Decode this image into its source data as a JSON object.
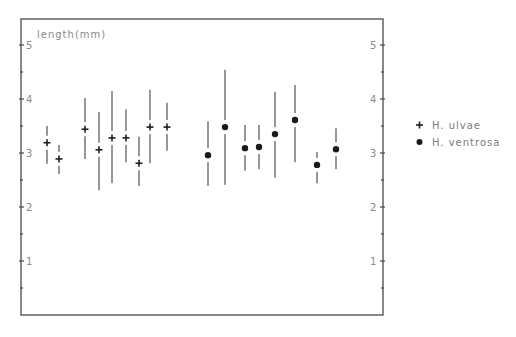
{
  "chart_data": {
    "type": "scatter",
    "title": "",
    "xlabel": "",
    "ylabel": "length(mm)",
    "ylim": [
      0,
      5.5
    ],
    "yticks_major": [
      1,
      2,
      3,
      4,
      5
    ],
    "yticks_minor": [
      0.5,
      1.5,
      2.5,
      3.5,
      4.5
    ],
    "grid": false,
    "legend_position": "right, outside plot",
    "error_bars": true,
    "series": [
      {
        "name": "H. ulvae",
        "marker": "plus",
        "points": [
          {
            "x": 47,
            "mean": 3.19,
            "upper": 3.5,
            "lower": 2.8
          },
          {
            "x": 59,
            "mean": 2.89,
            "upper": 3.15,
            "lower": 2.61
          },
          {
            "x": 85,
            "mean": 3.44,
            "upper": 4.02,
            "lower": 2.89
          },
          {
            "x": 99,
            "mean": 3.06,
            "upper": 3.76,
            "lower": 2.31
          },
          {
            "x": 112,
            "mean": 3.28,
            "upper": 4.15,
            "lower": 2.44
          },
          {
            "x": 126,
            "mean": 3.28,
            "upper": 3.81,
            "lower": 2.83
          },
          {
            "x": 139,
            "mean": 2.81,
            "upper": 3.3,
            "lower": 2.39
          },
          {
            "x": 150,
            "mean": 3.48,
            "upper": 4.17,
            "lower": 2.81
          },
          {
            "x": 167,
            "mean": 3.48,
            "upper": 3.93,
            "lower": 3.04
          }
        ]
      },
      {
        "name": "H. ventrosa",
        "marker": "dot",
        "points": [
          {
            "x": 208,
            "mean": 2.96,
            "upper": 3.59,
            "lower": 2.39
          },
          {
            "x": 225,
            "mean": 3.48,
            "upper": 4.54,
            "lower": 2.41
          },
          {
            "x": 245,
            "mean": 3.09,
            "upper": 3.52,
            "lower": 2.67
          },
          {
            "x": 259,
            "mean": 3.11,
            "upper": 3.52,
            "lower": 2.7
          },
          {
            "x": 275,
            "mean": 3.35,
            "upper": 4.13,
            "lower": 2.54
          },
          {
            "x": 295,
            "mean": 3.61,
            "upper": 4.26,
            "lower": 2.83
          },
          {
            "x": 317,
            "mean": 2.78,
            "upper": 3.02,
            "lower": 2.44
          },
          {
            "x": 336,
            "mean": 3.07,
            "upper": 3.46,
            "lower": 2.7
          }
        ]
      }
    ]
  },
  "axis": {
    "y_title": "length(mm)",
    "left_labels": [
      "1",
      "2",
      "3",
      "4",
      "5"
    ],
    "right_labels": [
      "1",
      "2",
      "3",
      "4",
      "5"
    ]
  },
  "legend": {
    "items": [
      {
        "label": "H. ulvae",
        "marker": "plus"
      },
      {
        "label": "H. ventrosa",
        "marker": "dot"
      }
    ]
  },
  "colors": {
    "frame": "#4a4a4a",
    "error_bar": "#7d7d7d",
    "marker": "#1a1a1a",
    "text": "#8a8a8a"
  }
}
